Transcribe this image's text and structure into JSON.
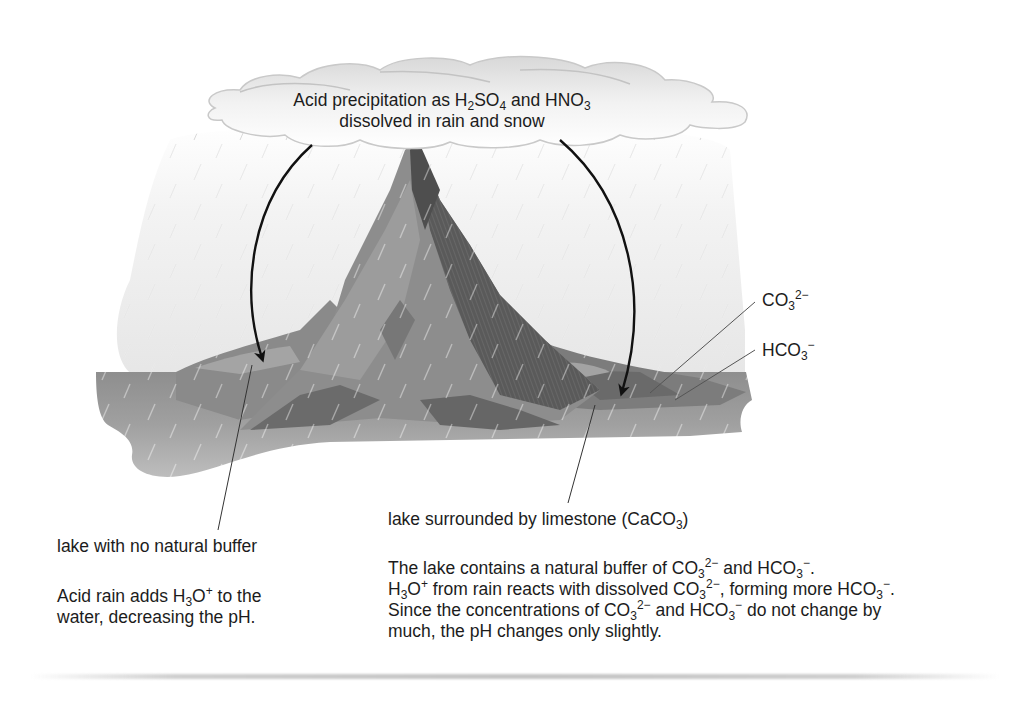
{
  "cloud_label": {
    "line1_a": "Acid precipitation as H",
    "line1_sub1": "2",
    "line1_b": "SO",
    "line1_sub2": "4",
    "line1_c": " and HNO",
    "line1_sub3": "3",
    "line2": "dissolved in rain and snow"
  },
  "ion_labels": {
    "carbonate": {
      "base": "CO",
      "sub": "3",
      "sup": "2−"
    },
    "bicarbonate": {
      "base": "HCO",
      "sub": "3",
      "sup": "−"
    }
  },
  "left_lake": {
    "title": "lake with no natural buffer",
    "desc_line1_a": "Acid rain adds H",
    "desc_line1_sub": "3",
    "desc_line1_b": "O",
    "desc_line1_sup": "+",
    "desc_line1_c": " to the",
    "desc_line2": "water, decreasing the pH."
  },
  "right_lake": {
    "title_a": "lake surrounded by limestone (CaCO",
    "title_sub": "3",
    "title_b": ")",
    "p1_a": "The lake contains a natural buffer of CO",
    "p1_sub1": "3",
    "p1_sup1": "2−",
    "p1_b": " and HCO",
    "p1_sub2": "3",
    "p1_sup2": "−",
    "p1_c": ".",
    "p2_a": "H",
    "p2_sub1": "3",
    "p2_b": "O",
    "p2_sup1": "+",
    "p2_c": " from rain reacts with dissolved CO",
    "p2_sub2": "3",
    "p2_sup2": "2−",
    "p2_d": ", forming more HCO",
    "p2_sub3": "3",
    "p2_sup3": "−",
    "p2_e": ".",
    "p3_a": "Since the concentrations of CO",
    "p3_sub1": "3",
    "p3_sup1": "2−",
    "p3_b": " and HCO",
    "p3_sub2": "3",
    "p3_sup2": "−",
    "p3_c": " do not change by",
    "p4": "much, the pH changes only slightly."
  },
  "colors": {
    "water": "#a8a8a8",
    "mountain_light": "#8f8f8f",
    "mountain_dark": "#5e5e5e",
    "arrow": "#111111",
    "rain_haze": "#f0f0f0"
  }
}
